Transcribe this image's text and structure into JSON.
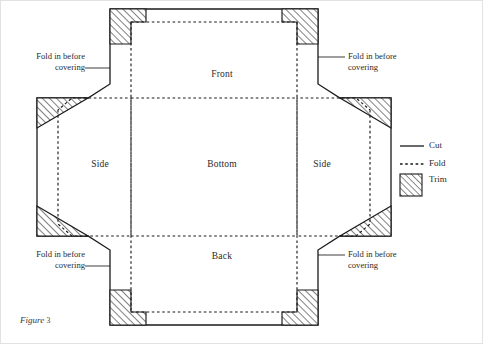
{
  "figure": {
    "caption_prefix": "Figure",
    "caption_number": "3"
  },
  "panels": [
    {
      "id": "front",
      "label": "Front",
      "x": 222,
      "y": 74
    },
    {
      "id": "side_left",
      "label": "Side",
      "x": 100,
      "y": 164
    },
    {
      "id": "bottom",
      "label": "Bottom",
      "x": 222,
      "y": 164
    },
    {
      "id": "side_right",
      "label": "Side",
      "x": 322,
      "y": 164
    },
    {
      "id": "back",
      "label": "Back",
      "x": 222,
      "y": 256
    }
  ],
  "callouts": [
    {
      "id": "top-left",
      "line1": "Fold in before",
      "line2": "covering"
    },
    {
      "id": "top-right",
      "line1": "Fold in before",
      "line2": "covering"
    },
    {
      "id": "bottom-left",
      "line1": "Fold in before",
      "line2": "covering"
    },
    {
      "id": "bottom-right",
      "line1": "Fold in before",
      "line2": "covering"
    }
  ],
  "legend": {
    "items": [
      {
        "id": "cut",
        "label": "Cut",
        "style": "solid-line"
      },
      {
        "id": "fold",
        "label": "Fold",
        "style": "dashed-line"
      },
      {
        "id": "trim",
        "label": "Trim",
        "style": "hatched-swatch"
      }
    ]
  },
  "colors": {
    "ink": "#1a1a1a",
    "cut_line": "#1a1a1a",
    "fold_line": "#1a1a1a",
    "hatch": "#1a1a1a",
    "page_border": "#e2e2e2",
    "paper": "#ffffff"
  }
}
